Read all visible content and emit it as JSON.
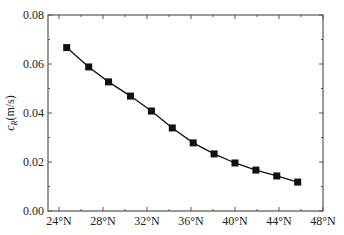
{
  "chart_data": {
    "type": "line",
    "title": "",
    "xlabel": "",
    "ylabel": "c_R(m/s)",
    "ylabel_main": "c",
    "ylabel_sub": "R",
    "ylabel_unit": "(m/s)",
    "xlim": [
      23,
      48
    ],
    "ylim": [
      0,
      0.08
    ],
    "grid": false,
    "legend": null,
    "x_ticks": [
      24,
      28,
      32,
      36,
      40,
      44,
      48
    ],
    "x_tick_labels": [
      "24°N",
      "28°N",
      "32°N",
      "36°N",
      "40°N",
      "44°N",
      "48°N"
    ],
    "x_minor_ticks": [
      26,
      30,
      34,
      38,
      42,
      46
    ],
    "y_ticks": [
      0,
      0.02,
      0.04,
      0.06,
      0.08
    ],
    "y_tick_labels": [
      "0.00",
      "0.02",
      "0.04",
      "0.06",
      "0.08"
    ],
    "y_minor_ticks": [
      0.01,
      0.03,
      0.05,
      0.07
    ],
    "series": [
      {
        "name": "c_R",
        "marker": "square",
        "color": "#111111",
        "x": [
          24.7,
          26.7,
          28.5,
          30.5,
          32.4,
          34.3,
          36.2,
          38.1,
          40.0,
          41.9,
          43.8,
          45.7
        ],
        "y": [
          0.0667,
          0.0588,
          0.0527,
          0.0469,
          0.0408,
          0.0339,
          0.0278,
          0.0233,
          0.0196,
          0.0167,
          0.0143,
          0.0118
        ]
      }
    ]
  }
}
